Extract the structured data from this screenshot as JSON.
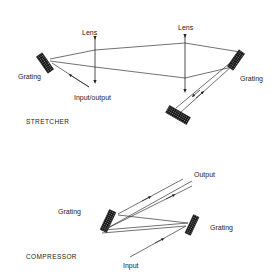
{
  "stretcher": {
    "title": "STRETCHER",
    "labels": {
      "lens_left": "Lens",
      "lens_right": "Lens",
      "grating_left": "Grating",
      "grating_right": "Grating",
      "input_output": "Input/output"
    }
  },
  "compressor": {
    "title": "COMPRESSOR",
    "labels": {
      "output": "Output",
      "grating_left": "Grating",
      "grating_right": "Grating",
      "input": "Input"
    }
  },
  "colors": {
    "line": "#333333",
    "grating": "#111111",
    "text": "#222222"
  }
}
